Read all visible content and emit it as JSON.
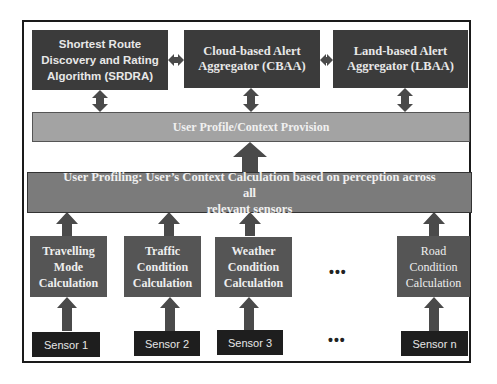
{
  "diagram": {
    "top_boxes": [
      {
        "id": "srdra",
        "label_lines": [
          "Shortest Route",
          "Discovery and Rating",
          "Algorithm (SRDRA)"
        ]
      },
      {
        "id": "cbaa",
        "label_lines": [
          "Cloud-based Alert",
          "Aggregator (CBAA)"
        ]
      },
      {
        "id": "lbaa",
        "label_lines": [
          "Land-based Alert",
          "Aggregator (LBAA)"
        ]
      }
    ],
    "profile_provision": {
      "label": "User Profile/Context Provision"
    },
    "profiling": {
      "label_lines": [
        "User Profiling: User’s Context Calculation based on perception across all",
        "relevant sensors"
      ]
    },
    "calculations": [
      {
        "id": "travelling",
        "label_lines": [
          "Travelling",
          "Mode",
          "Calculation"
        ]
      },
      {
        "id": "traffic",
        "label_lines": [
          "Traffic",
          "Condition",
          "Calculation"
        ]
      },
      {
        "id": "weather",
        "label_lines": [
          "Weather",
          "Condition",
          "Calculation"
        ]
      },
      {
        "id": "road",
        "label_lines": [
          "Road",
          "Condition",
          "Calculation"
        ]
      }
    ],
    "ellipsis": "•••",
    "sensors": [
      {
        "label": "Sensor 1"
      },
      {
        "label": "Sensor 2"
      },
      {
        "label": "Sensor 3"
      },
      {
        "label": "Sensor n"
      }
    ],
    "colors": {
      "top_box": "#3b3b3b",
      "provision_bar": "#a3a3a3",
      "profiling_bar": "#7b7b7b",
      "calc_box": "#555555",
      "sensor_box": "#1e1e1e",
      "arrow": "#4a4a4a"
    }
  }
}
